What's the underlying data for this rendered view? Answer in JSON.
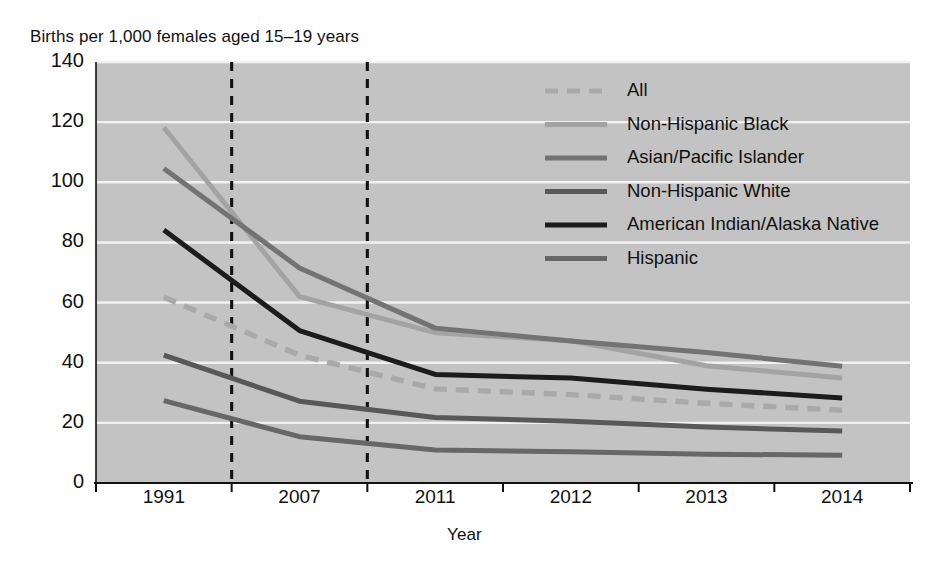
{
  "chart_data": {
    "type": "line",
    "title": "",
    "ylabel": "Births per 1,000 females aged 15–19 years",
    "xlabel": "Year",
    "categories": [
      "1991",
      "2007",
      "2011",
      "2012",
      "2013",
      "2014"
    ],
    "ylim": [
      0,
      140
    ],
    "yticks": [
      "0",
      "20",
      "40",
      "60",
      "80",
      "100",
      "120",
      "140"
    ],
    "grid": true,
    "legend_position": "top-right",
    "plot_background": "#c3c3c3",
    "gridline_color": "#f2f2f2",
    "reference_lines": [
      "2007",
      "2011"
    ],
    "series": [
      {
        "name": "All",
        "color": "#a9a9a9",
        "style": "dashed",
        "values": [
          61.8,
          42.5,
          31.3,
          29.4,
          26.5,
          24.2
        ]
      },
      {
        "name": "Non-Hispanic Black",
        "color": "#a3a3a3",
        "style": "solid",
        "values": [
          118.2,
          62.0,
          50.0,
          47.3,
          39.0,
          34.9
        ]
      },
      {
        "name": "Asian/Pacific Islander",
        "color": "#737373",
        "style": "solid",
        "values": [
          104.6,
          71.5,
          51.5,
          47.2,
          43.4,
          38.8
        ]
      },
      {
        "name": "Non-Hispanic White",
        "color": "#585858",
        "style": "solid",
        "values": [
          42.5,
          27.2,
          21.8,
          20.5,
          18.6,
          17.3
        ]
      },
      {
        "name": "American Indian/Alaska Native",
        "color": "#1c1c1c",
        "style": "solid",
        "values": [
          84.1,
          50.7,
          36.1,
          34.9,
          31.2,
          28.3
        ]
      },
      {
        "name": "Hispanic",
        "color": "#676767",
        "style": "solid",
        "values": [
          27.4,
          15.4,
          11.0,
          10.4,
          9.6,
          9.2
        ]
      }
    ]
  },
  "legend": {
    "items": [
      {
        "label": "All"
      },
      {
        "label": "Non-Hispanic Black"
      },
      {
        "label": "Asian/Pacific Islander"
      },
      {
        "label": "Non-Hispanic White"
      },
      {
        "label": "American Indian/Alaska Native"
      },
      {
        "label": "Hispanic"
      }
    ]
  }
}
